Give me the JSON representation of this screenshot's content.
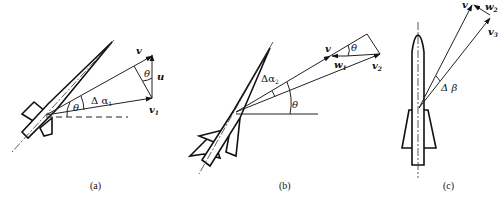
{
  "panels": [
    {
      "id": "a",
      "caption": "(a)",
      "labels": {
        "v": "v",
        "u": "u",
        "v1": "v",
        "v1_sub": "1",
        "theta_top": "θ",
        "theta_bottom": "θ",
        "delta_alpha": "Δ α",
        "delta_alpha_sub": "1"
      }
    },
    {
      "id": "b",
      "caption": "(b)",
      "labels": {
        "v": "v",
        "w1": "w",
        "w1_sub": "1",
        "v2": "v",
        "v2_sub": "2",
        "theta_top": "θ",
        "theta_bottom": "θ",
        "delta_alpha": "Δα",
        "delta_alpha_sub": "2"
      }
    },
    {
      "id": "c",
      "caption": "(c)",
      "labels": {
        "v": "v",
        "w2": "w",
        "w2_sub": "2",
        "v3": "v",
        "v3_sub": "3",
        "delta_beta": "Δ β"
      }
    }
  ]
}
